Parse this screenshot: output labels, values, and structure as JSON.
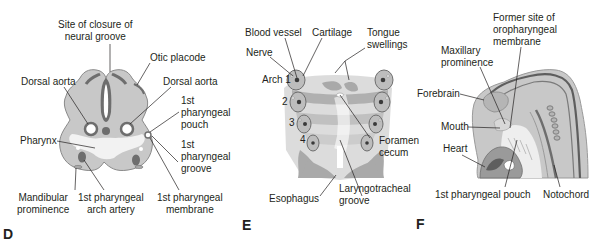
{
  "figure": {
    "colors": {
      "tissue_light": "#c8c8c8",
      "tissue_mid": "#a9a9a9",
      "tissue_dark": "#6e6e6e",
      "lumen": "#f2f2f2",
      "line": "#231f20"
    },
    "panels": [
      {
        "letter": "D",
        "labels": {
          "site_closure": "Site of closure of\nneural groove",
          "otic_placode": "Otic placode",
          "dorsal_aorta_left": "Dorsal aorta",
          "dorsal_aorta_right": "Dorsal aorta",
          "first_pouch": "1st\npharyngeal\npouch",
          "pharynx": "Pharynx",
          "first_groove": "1st\npharyngeal\ngroove",
          "mandibular": "Mandibular\nprominence",
          "arch_artery": "1st pharyngeal\narch artery",
          "membrane": "1st pharyngeal\nmembrane"
        }
      },
      {
        "letter": "E",
        "labels": {
          "blood_vessel": "Blood vessel",
          "cartilage": "Cartilage",
          "tongue": "Tongue\nswellings",
          "nerve": "Nerve",
          "arch1": "Arch 1",
          "arch2": "2",
          "arch3": "3",
          "arch4": "4",
          "foramen": "Foramen\ncecum",
          "esophagus": "Esophagus",
          "laryngotracheal": "Laryngotracheal\ngroove"
        }
      },
      {
        "letter": "F",
        "labels": {
          "former_site": "Former site of\noropharyngeal\nmembrane",
          "maxillary": "Maxillary\nprominence",
          "forebrain": "Forebrain",
          "mouth": "Mouth",
          "heart": "Heart",
          "pouch": "1st pharyngeal pouch",
          "notochord": "Notochord"
        }
      }
    ]
  }
}
